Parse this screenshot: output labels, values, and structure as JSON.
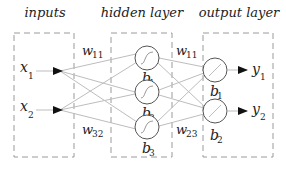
{
  "colors": {
    "box_stroke": "#9a9a9a",
    "edge_stroke": "#bdbdbd",
    "node_stroke": "#555555",
    "arrow_fill": "#111111",
    "text": "#222222"
  },
  "layers": [
    {
      "id": "inputs",
      "title": "inputs"
    },
    {
      "id": "hidden",
      "title": "hidden layer"
    },
    {
      "id": "output",
      "title": "output layer"
    }
  ],
  "inputs": [
    {
      "var": "x",
      "sub": "1"
    },
    {
      "var": "x",
      "sub": "2"
    }
  ],
  "hidden_nodes": [
    {
      "bias_var": "b",
      "bias_sub": "1",
      "activation": "sigmoid-icon"
    },
    {
      "bias_var": "b",
      "bias_sub": "2",
      "activation": "sigmoid-icon"
    },
    {
      "bias_var": "b",
      "bias_sub": "3",
      "activation": "sigmoid-icon"
    }
  ],
  "output_nodes": [
    {
      "bias_var": "b",
      "bias_sub": "1",
      "activation": "linear-icon",
      "out_var": "y",
      "out_sub": "1"
    },
    {
      "bias_var": "b",
      "bias_sub": "2",
      "activation": "linear-icon",
      "out_var": "y",
      "out_sub": "2"
    }
  ],
  "weight_labels": {
    "input_hidden_top": {
      "var": "w",
      "sub": "11"
    },
    "input_hidden_bottom": {
      "var": "w",
      "sub": "32"
    },
    "hidden_output_top": {
      "var": "w",
      "sub": "11"
    },
    "hidden_output_bottom": {
      "var": "w",
      "sub": "23"
    }
  }
}
